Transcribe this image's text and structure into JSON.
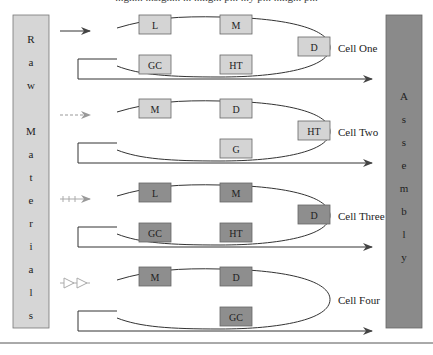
{
  "caption_fragment": "...gn... ...sign... ... ...ng... p... ...y p... ...ng... p...",
  "colors": {
    "light_fill": "#d4d4d4",
    "dark_fill": "#8e8e8e",
    "raw_materials_fill": "#d6d6d6",
    "assembly_fill": "#8a8a8a",
    "line": "#333333",
    "light_arrow": "#999999"
  },
  "raw_materials": {
    "label": "Raw Materials",
    "letters": [
      "R",
      "a",
      "w",
      "",
      "M",
      "a",
      "t",
      "e",
      "r",
      "i",
      "a",
      "l",
      "s"
    ]
  },
  "assembly": {
    "label": "Assembly",
    "letters": [
      "A",
      "s",
      "s",
      "e",
      "m",
      "b",
      "l",
      "y"
    ]
  },
  "cells": [
    {
      "name": "Cell One",
      "input_arrow_style": "solid",
      "shade": "light",
      "stations": {
        "top_left": "L",
        "top_right": "M",
        "tip": "D",
        "bottom_left": "GC",
        "bottom_right": "HT"
      }
    },
    {
      "name": "Cell Two",
      "input_arrow_style": "dashed",
      "shade": "light",
      "stations": {
        "top_left": "M",
        "top_right": "D",
        "tip": "HT",
        "bottom_left": "",
        "bottom_right": "G"
      }
    },
    {
      "name": "Cell Three",
      "input_arrow_style": "plus",
      "shade": "dark",
      "stations": {
        "top_left": "L",
        "top_right": "M",
        "tip": "D",
        "bottom_left": "GC",
        "bottom_right": "HT"
      }
    },
    {
      "name": "Cell Four",
      "input_arrow_style": "triangles",
      "shade": "dark",
      "stations": {
        "top_left": "M",
        "top_right": "D",
        "tip": "",
        "bottom_left": "",
        "bottom_right": "GC"
      }
    }
  ]
}
